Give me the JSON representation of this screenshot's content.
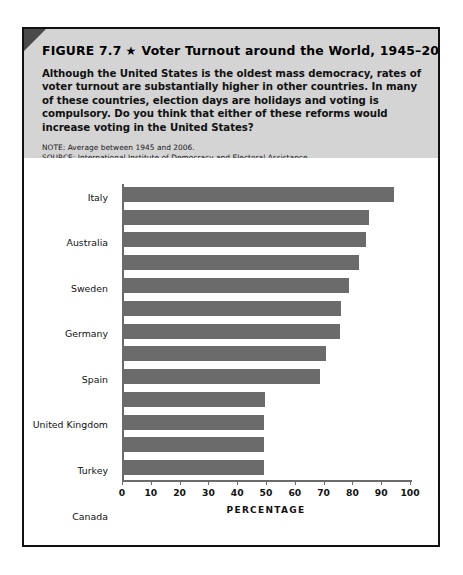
{
  "figure": {
    "label": "FIGURE 7.7",
    "star": "★",
    "title": "Voter Turnout around the World, 1945–2006",
    "description": "Although the United States is the oldest mass democracy, rates of voter turnout are substantially higher in other countries. In many of these countries, election days are holidays and voting is compulsory. Do you think that either of these reforms would increase voting in the United States?",
    "note": "NOTE: Average between 1945 and 2006.",
    "source": "SOURCE: International Institute of Democracy and Electoral Assistance."
  },
  "colors": {
    "bar": "#6b6b6b",
    "header_background": "#d4d4d4",
    "border": "#111111",
    "axis": "#6b6b6b"
  },
  "chart_data": {
    "type": "bar",
    "orientation": "horizontal",
    "title": "Voter Turnout around the World, 1945–2006",
    "xlabel": "PERCENTAGE",
    "ylabel": "",
    "xlim": [
      0,
      100
    ],
    "grid": false,
    "legend": null,
    "ticks": [
      0,
      10,
      20,
      30,
      40,
      50,
      60,
      70,
      80,
      90,
      100
    ],
    "categories": [
      "Italy",
      "Australia",
      "Sweden",
      "Germany",
      "Spain",
      "United Kingdom",
      "Turkey",
      "Canada",
      "France",
      "United States",
      "Mexico",
      "Brazil",
      "Thailand"
    ],
    "values": [
      93.6,
      85,
      84,
      81.5,
      78,
      75.5,
      75,
      70,
      68,
      49,
      48.5,
      48.5,
      48.5
    ]
  }
}
